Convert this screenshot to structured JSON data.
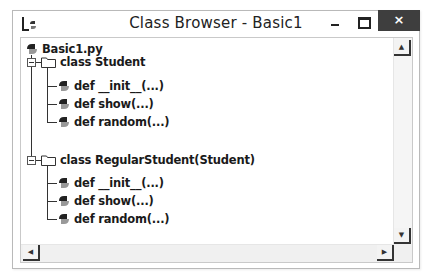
{
  "window": {
    "title": "Class Browser - Basic1",
    "app_icon": "idle-python-icon",
    "controls": {
      "minimize": "minimize-icon",
      "maximize": "maximize-icon",
      "close_label": "×"
    }
  },
  "tree": {
    "root": {
      "label": "Basic1.py",
      "icon": "python-file-icon",
      "expanded": true
    },
    "classes": [
      {
        "label": "class Student",
        "icon": "folder-icon",
        "expanded": true,
        "methods": [
          {
            "label": "def __init__(...)",
            "icon": "python-method-icon"
          },
          {
            "label": "def show(...)",
            "icon": "python-method-icon"
          },
          {
            "label": "def random(...)",
            "icon": "python-method-icon"
          }
        ]
      },
      {
        "label": "class RegularStudent(Student)",
        "icon": "folder-icon",
        "expanded": true,
        "methods": [
          {
            "label": "def __init__(...)",
            "icon": "python-method-icon"
          },
          {
            "label": "def show(...)",
            "icon": "python-method-icon"
          },
          {
            "label": "def random(...)",
            "icon": "python-method-icon"
          }
        ]
      }
    ]
  },
  "scrollbars": {
    "up_arrow": "▲",
    "down_arrow": "▼",
    "left_arrow": "◀",
    "right_arrow": "▶"
  }
}
